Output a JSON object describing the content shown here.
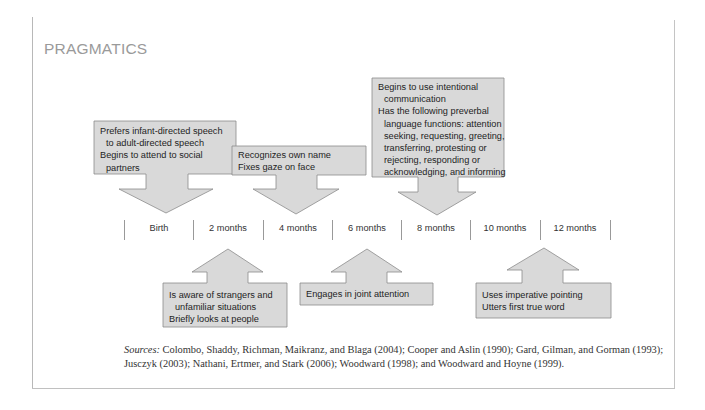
{
  "title": "PRAGMATICS",
  "timeline": [
    "Birth",
    "2 months",
    "4 months",
    "6 months",
    "8 months",
    "10 months",
    "12 months"
  ],
  "above_boxes": [
    {
      "points_to": "Birth",
      "lines": [
        "Prefers infant-directed speech",
        "to adult-directed speech",
        "Begins to attend to social",
        "partners"
      ]
    },
    {
      "points_to": "4 months",
      "lines": [
        "Recognizes own name",
        "Fixes gaze on face"
      ]
    },
    {
      "points_to": "8 months",
      "lines": [
        "Begins to use intentional",
        "communication",
        "Has the following preverbal",
        "language functions: attention",
        "seeking, requesting, greeting,",
        "transferring, protesting or",
        "rejecting, responding or",
        "acknowledging, and informing"
      ]
    }
  ],
  "below_boxes": [
    {
      "points_to": "2 months",
      "lines": [
        "Is aware of strangers and",
        "unfamiliar situations",
        "Briefly looks at people"
      ]
    },
    {
      "points_to": "6 months",
      "lines": [
        "Engages in joint attention"
      ]
    },
    {
      "points_to": "10 months",
      "lines": [
        "Uses imperative pointing",
        "Utters first true word"
      ]
    }
  ],
  "sources": {
    "label": "Sources:",
    "text": " Colombo, Shaddy, Richman, Maikranz, and Blaga (2004); Cooper and Aslin (1990); Gard, Gilman, and Gorman (1993); Jusczyk (2003); Nathani, Ertmer, and Stark (2006); Woodward (1998); and Woodward and Hoyne (1999)."
  },
  "colors": {
    "box_fill": "#d9d9d9",
    "box_stroke": "#8c8c8c",
    "title": "#9a9a9a"
  }
}
